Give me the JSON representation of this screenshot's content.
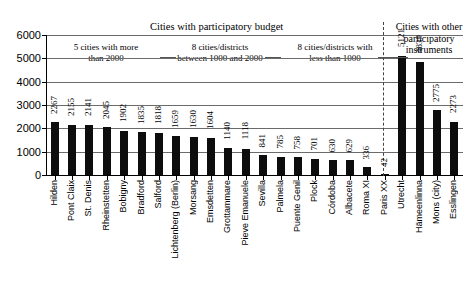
{
  "chart_data": {
    "type": "bar",
    "title": "",
    "xlabel": "",
    "ylabel": "",
    "ylim": [
      0,
      6000
    ],
    "ytick_values": [
      0,
      1000,
      2000,
      3000,
      4000,
      5000,
      6000
    ],
    "ytick_labels": [
      "0",
      "1000",
      "2000",
      "3000",
      "4000",
      "5000",
      "6000"
    ],
    "grid": true,
    "legend": "none",
    "categories": [
      "Hilden",
      "Pont Claix",
      "St. Denis",
      "Rheinstetten",
      "Bobigny",
      "Bradford",
      "Salford",
      "Lichtenberg (Berlin)",
      "Morsang",
      "Emsdetten",
      "Grottammare",
      "Pieve Emanuele",
      "Sevilla",
      "Palmela",
      "Puente Genil",
      "Plock",
      "Córdoba",
      "Albacete",
      "Roma XI",
      "Paris XX",
      "Utrecht",
      "Hämeenlinna",
      "Mons (city)",
      "Esslingen"
    ],
    "values": [
      2267,
      2155,
      2141,
      2045,
      1902,
      1835,
      1818,
      1659,
      1630,
      1604,
      1140,
      1118,
      841,
      785,
      758,
      701,
      630,
      629,
      336,
      42,
      5121,
      4839,
      2775,
      2273
    ],
    "bar_color": "#0d0d0d",
    "groups": [
      {
        "label": "5 cities with more than 2000",
        "start": 0,
        "count": 4
      },
      {
        "label": "8 cities/districts between 1000 and 2000",
        "start": 4,
        "count": 8
      },
      {
        "label": "8 cities/districts with less than 1000",
        "start": 12,
        "count": 8
      },
      {
        "label": "Cities with other participatory instruments",
        "start": 20,
        "count": 4
      }
    ],
    "super_headers": [
      {
        "label": "Cities with participatory budget",
        "covers": [
          0,
          19
        ]
      },
      {
        "label": "Cities with other participatory instruments",
        "covers": [
          20,
          23
        ]
      }
    ],
    "annotations": [
      "5 cities with more than 2000",
      "8 cities/districts between 1000 and 2000",
      "8 cities/districts with less than 1000"
    ]
  },
  "headers": {
    "left_group_title": "Cities with participatory budget",
    "right_group_title_line1": "Cities with other",
    "right_group_title_line2": "participatory",
    "right_group_title_line3": "instruments"
  },
  "annotations": {
    "a1_line1": "5 cities with more",
    "a1_line2": "than 2000",
    "a2_line1": "8 cities/districts",
    "a2_line2": "between 1000 and 2000",
    "a3_line1": "8 cities/districts with",
    "a3_line2": "less than 1000"
  }
}
